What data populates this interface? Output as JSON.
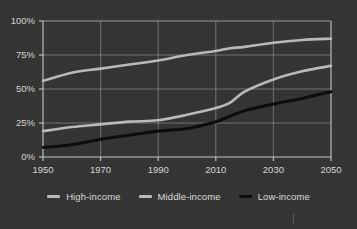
{
  "chart_data": {
    "type": "line",
    "title": "",
    "subtitle": "",
    "xlabel": "",
    "ylabel": "",
    "xlim": [
      1950,
      2050
    ],
    "ylim": [
      0,
      100
    ],
    "grid": true,
    "legend_position": "bottom",
    "x_ticks": [
      "1950",
      "1970",
      "1990",
      "2010",
      "2030",
      "2050"
    ],
    "x_tick_values": [
      1950,
      1970,
      1990,
      2010,
      2030,
      2050
    ],
    "y_ticks": [
      "0%",
      "25%",
      "50%",
      "75%",
      "100%"
    ],
    "y_tick_values": [
      0,
      25,
      50,
      75,
      100
    ],
    "x": [
      1950,
      1960,
      1970,
      1980,
      1990,
      2000,
      2010,
      2015,
      2020,
      2030,
      2040,
      2050
    ],
    "series": [
      {
        "name": "High-income",
        "color": "#b9b9b9",
        "width": 2.6,
        "values": [
          56,
          62,
          65,
          68,
          71,
          75,
          78,
          80,
          81,
          84,
          86,
          87
        ]
      },
      {
        "name": "Middle-income",
        "color": "#b9b9b9",
        "width": 2.6,
        "values": [
          19,
          22,
          24,
          26,
          27,
          31,
          36,
          40,
          48,
          57,
          63,
          67
        ]
      },
      {
        "name": "Low-income",
        "color": "#0d0d0d",
        "width": 3.1,
        "values": [
          7,
          9,
          13,
          16,
          19,
          21,
          26,
          30,
          34,
          39,
          43,
          48
        ]
      }
    ]
  },
  "colors": {
    "background": "#333333",
    "grid": "#9a9a9a",
    "axis": "#c9c9c9",
    "text": "#d8d8d8",
    "light_series": "#b9b9b9",
    "dark_series": "#0d0d0d"
  },
  "legend": {
    "items": [
      {
        "label": "High-income",
        "color": "#b9b9b9"
      },
      {
        "label": "Middle-income",
        "color": "#b9b9b9"
      },
      {
        "label": "Low-income",
        "color": "#0d0d0d"
      }
    ]
  }
}
